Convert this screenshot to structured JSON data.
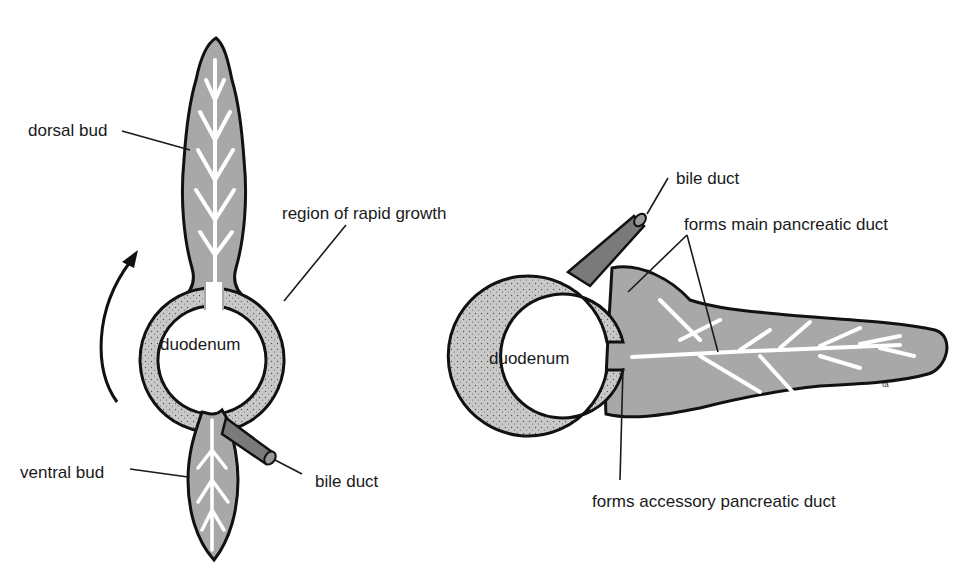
{
  "figure": {
    "left_panel": {
      "labels": {
        "dorsal_bud": "dorsal bud",
        "region_rapid_growth": "region of rapid growth",
        "duodenum": "duodenum",
        "ventral_bud": "ventral bud",
        "bile_duct": "bile duct"
      },
      "rotation_arrow": "curved-arrow-counterclockwise"
    },
    "right_panel": {
      "labels": {
        "bile_duct": "bile duct",
        "main_pancreatic_duct": "forms main pancreatic duct",
        "duodenum": "duodenum",
        "accessory_pancreatic_duct": "forms accessory pancreatic duct"
      }
    },
    "colors": {
      "tissue_gray": "#a8a8a8",
      "wall_stipple": "#c4c4c4",
      "bile_duct_dark": "#7a7a7a",
      "outline": "#111111",
      "background": "#ffffff"
    }
  }
}
